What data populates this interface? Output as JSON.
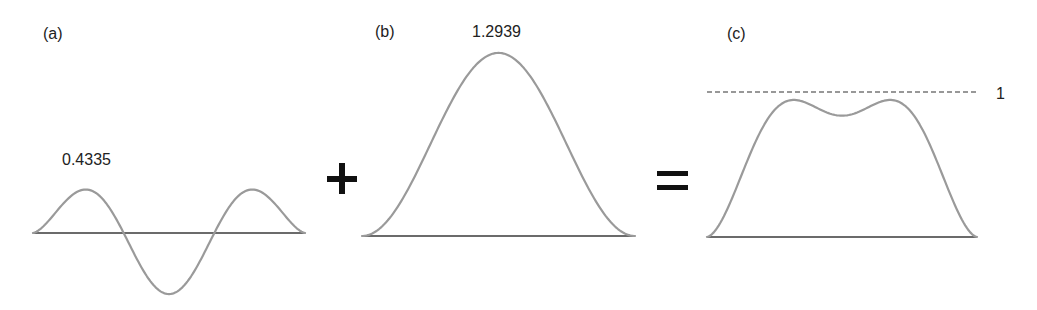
{
  "panels": [
    {
      "id": "a",
      "label": "(a)",
      "value_label": "0.4335",
      "peak_value": 0.4335
    },
    {
      "id": "b",
      "label": "(b)",
      "value_label": "1.2939",
      "peak_value": 1.2939
    },
    {
      "id": "c",
      "label": "(c)",
      "reference_label": "1",
      "reference_value": 1
    }
  ],
  "operators": {
    "plus": "+",
    "equals": "="
  },
  "colors": {
    "curve": "#9a9a9a",
    "axis": "#3a3a3a",
    "operator": "#111111",
    "text": "#222222"
  },
  "chart_data": [
    {
      "type": "line",
      "title": "(a)",
      "description": "Oscillating component with 1.5 periods: positive peak, negative trough, positive peak",
      "annotations": [
        "0.4335"
      ],
      "peak": 0.4335,
      "trough": -0.4335,
      "x_span": [
        0,
        1
      ],
      "peaks_at_x": [
        0.217,
        0.79
      ],
      "trough_at_x": 0.5
    },
    {
      "type": "line",
      "title": "(b)",
      "description": "Single smooth bump",
      "annotations": [
        "1.2939"
      ],
      "peak": 1.2939,
      "peak_at_x": 0.5
    },
    {
      "type": "line",
      "title": "(c)",
      "description": "Sum (a)+(b): two peaks above reference level 1 with a dip below it",
      "annotations": [
        "1"
      ],
      "reference_line": 1,
      "peaks": [
        1.15,
        1.15
      ],
      "dip": 0.87
    }
  ]
}
